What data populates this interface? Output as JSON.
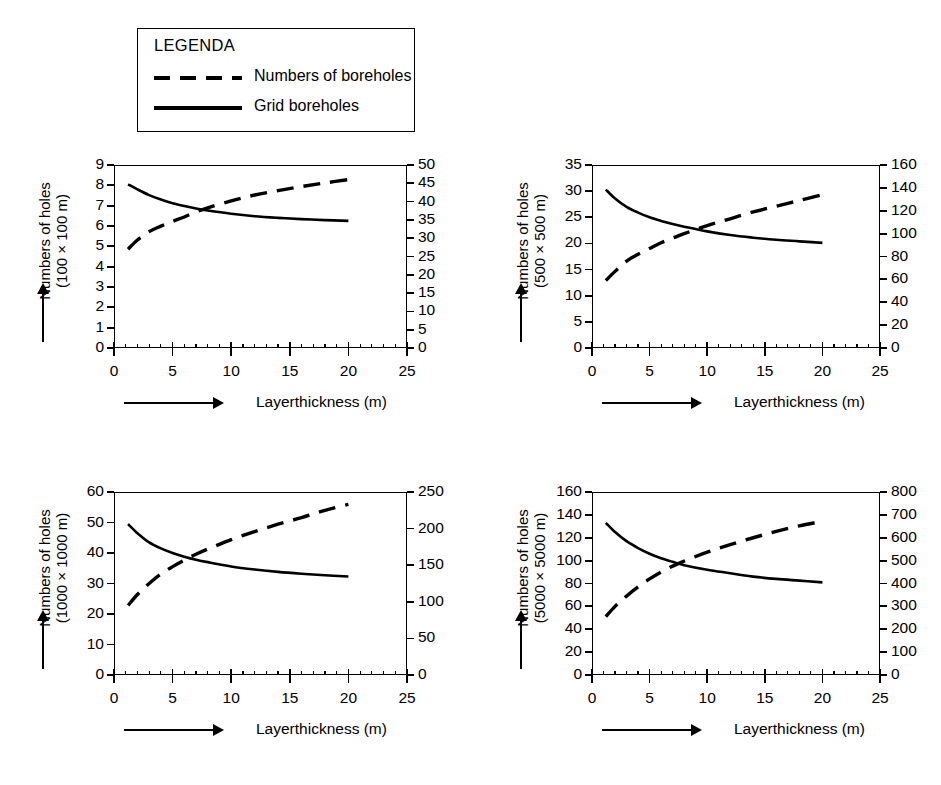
{
  "legend": {
    "title": "LEGENDA",
    "items": [
      {
        "style": "dashed",
        "label": "Numbers of boreholes"
      },
      {
        "style": "solid",
        "label": "Grid boreholes"
      }
    ]
  },
  "common": {
    "xlabel": "Layerthickness (m)",
    "x_ticks": [
      "0",
      "5",
      "10",
      "15",
      "20",
      "25"
    ],
    "ylabel_line1": "Numbers of holes"
  },
  "chart_data": [
    {
      "type": "line",
      "id": "grid-100x100",
      "title": "",
      "ylabel": "Numbers of holes (100 × 100 m)",
      "ylabel_line2": "(100 × 100 m)",
      "xlabel": "Layerthickness (m)",
      "xlim": [
        0,
        25
      ],
      "x_ticks": [
        0,
        5,
        10,
        15,
        20,
        25
      ],
      "ylim": [
        0,
        9
      ],
      "y_ticks": [
        0,
        1,
        2,
        3,
        4,
        5,
        6,
        7,
        8,
        9
      ],
      "y_ticklabels": [
        "0",
        "1",
        "2",
        "3",
        "4",
        "5",
        "6",
        "7",
        "8",
        "9"
      ],
      "y2lim": [
        0,
        50
      ],
      "y2_ticks": [
        0,
        5,
        10,
        15,
        20,
        25,
        30,
        35,
        40,
        45,
        50
      ],
      "y2_ticklabels": [
        "0",
        "5",
        "10",
        "15",
        "20",
        "25",
        "30",
        "35",
        "40",
        "45",
        "50"
      ],
      "grid": false,
      "series": [
        {
          "name": "Grid boreholes",
          "style": "solid",
          "axis": "left",
          "x": [
            1.2,
            2,
            3,
            4,
            5,
            6,
            7,
            8,
            10,
            12,
            14,
            16,
            18,
            20
          ],
          "values": [
            8.05,
            7.8,
            7.52,
            7.3,
            7.12,
            6.98,
            6.86,
            6.76,
            6.6,
            6.48,
            6.4,
            6.34,
            6.29,
            6.25
          ]
        },
        {
          "name": "Numbers of boreholes",
          "style": "dashed",
          "axis": "right",
          "x": [
            1.2,
            2,
            3,
            4,
            5,
            6,
            7,
            8,
            10,
            12,
            14,
            16,
            18,
            20
          ],
          "values": [
            27.0,
            29.5,
            31.8,
            33.3,
            34.6,
            35.8,
            37.2,
            38.3,
            40.2,
            41.8,
            43.0,
            44.1,
            45.1,
            46.0
          ]
        }
      ]
    },
    {
      "type": "line",
      "id": "grid-500x500",
      "title": "",
      "ylabel": "Numbers of holes (500 × 500 m)",
      "ylabel_line2": "(500 × 500 m)",
      "xlabel": "Layerthickness (m)",
      "xlim": [
        0,
        25
      ],
      "x_ticks": [
        0,
        5,
        10,
        15,
        20,
        25
      ],
      "ylim": [
        0,
        35
      ],
      "y_ticks": [
        0,
        5,
        10,
        15,
        20,
        25,
        30,
        35
      ],
      "y_ticklabels": [
        "0",
        "5",
        "10",
        "15",
        "20",
        "25",
        "30",
        "35"
      ],
      "y2lim": [
        0,
        160
      ],
      "y2_ticks": [
        0,
        20,
        40,
        60,
        80,
        100,
        120,
        140,
        160
      ],
      "y2_ticklabels": [
        "0",
        "20",
        "40",
        "60",
        "80",
        "100",
        "120",
        "140",
        "160"
      ],
      "grid": false,
      "series": [
        {
          "name": "Grid boreholes",
          "style": "solid",
          "axis": "left",
          "x": [
            1.2,
            2,
            3,
            4,
            5,
            6,
            7,
            8,
            10,
            12,
            14,
            16,
            18,
            20
          ],
          "values": [
            30.3,
            28.6,
            27.0,
            25.9,
            25.0,
            24.3,
            23.7,
            23.2,
            22.3,
            21.6,
            21.1,
            20.7,
            20.4,
            20.1
          ]
        },
        {
          "name": "Numbers of boreholes",
          "style": "dashed",
          "axis": "right",
          "x": [
            1.2,
            2,
            3,
            4,
            5,
            6,
            7,
            8,
            10,
            12,
            14,
            16,
            18,
            20
          ],
          "values": [
            59,
            67,
            76,
            82,
            87,
            92,
            96,
            100,
            107,
            113,
            119,
            124,
            129,
            134
          ]
        }
      ]
    },
    {
      "type": "line",
      "id": "grid-1000x1000",
      "title": "",
      "ylabel": "Numbers of holes (1000 × 1000 m)",
      "ylabel_line2": "(1000 × 1000 m)",
      "xlabel": "Layerthickness (m)",
      "xlim": [
        0,
        25
      ],
      "x_ticks": [
        0,
        5,
        10,
        15,
        20,
        25
      ],
      "ylim": [
        0,
        60
      ],
      "y_ticks": [
        0,
        10,
        20,
        30,
        40,
        50,
        60
      ],
      "y_ticklabels": [
        "0",
        "10",
        "20",
        "30",
        "40",
        "50",
        "60"
      ],
      "y2lim": [
        0,
        250
      ],
      "y2_ticks": [
        0,
        50,
        100,
        150,
        200,
        250
      ],
      "y2_ticklabels": [
        "0",
        "50",
        "100",
        "150",
        "200",
        "250"
      ],
      "grid": false,
      "series": [
        {
          "name": "Grid boreholes",
          "style": "solid",
          "axis": "left",
          "x": [
            1.2,
            2,
            3,
            4,
            5,
            6,
            7,
            8,
            10,
            12,
            14,
            16,
            18,
            20
          ],
          "values": [
            49.5,
            46.5,
            43.5,
            41.5,
            40.0,
            38.8,
            37.8,
            37.0,
            35.6,
            34.6,
            33.8,
            33.2,
            32.7,
            32.3
          ]
        },
        {
          "name": "Numbers of boreholes",
          "style": "dashed",
          "axis": "right",
          "x": [
            1.2,
            2,
            3,
            4,
            5,
            6,
            7,
            8,
            10,
            12,
            14,
            16,
            18,
            20
          ],
          "values": [
            95,
            110,
            125,
            138,
            148,
            157,
            165,
            172,
            185,
            196,
            206,
            215,
            225,
            233
          ]
        }
      ]
    },
    {
      "type": "line",
      "id": "grid-5000x5000",
      "title": "",
      "ylabel": "Numbers of holes (5000 × 5000 m)",
      "ylabel_line2": "(5000 × 5000 m)",
      "xlabel": "Layerthickness (m)",
      "xlim": [
        0,
        25
      ],
      "x_ticks": [
        0,
        5,
        10,
        15,
        20,
        25
      ],
      "ylim": [
        0,
        160
      ],
      "y_ticks": [
        0,
        20,
        40,
        60,
        80,
        100,
        120,
        140,
        160
      ],
      "y_ticklabels": [
        "0",
        "20",
        "40",
        "60",
        "80",
        "100",
        "120",
        "140",
        "160"
      ],
      "y2lim": [
        0,
        800
      ],
      "y2_ticks": [
        0,
        100,
        200,
        300,
        400,
        500,
        600,
        700,
        800
      ],
      "y2_ticklabels": [
        "0",
        "100",
        "200",
        "300",
        "400",
        "500",
        "600",
        "700",
        "800"
      ],
      "grid": false,
      "series": [
        {
          "name": "Grid boreholes",
          "style": "solid",
          "axis": "left",
          "x": [
            1.2,
            2,
            3,
            4,
            5,
            6,
            7,
            8,
            10,
            12,
            14,
            16,
            18,
            20
          ],
          "values": [
            133,
            125,
            117,
            111,
            106,
            102,
            99,
            96,
            92,
            89,
            86,
            84,
            82.5,
            81
          ]
        },
        {
          "name": "Numbers of boreholes",
          "style": "dashed",
          "axis": "right",
          "x": [
            1.2,
            2,
            3,
            4,
            5,
            6,
            7,
            8,
            10,
            12,
            14,
            16,
            18,
            20
          ],
          "values": [
            255,
            300,
            345,
            385,
            420,
            450,
            476,
            498,
            537,
            570,
            600,
            628,
            652,
            672
          ]
        }
      ]
    }
  ]
}
